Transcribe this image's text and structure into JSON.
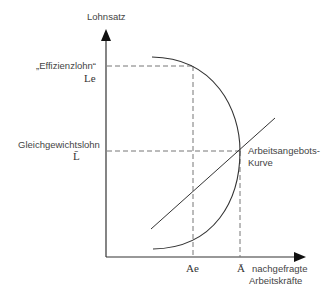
{
  "diagram": {
    "type": "economics-efficiency-wage-diagram",
    "y_axis": {
      "label": "Lohnsatz"
    },
    "x_axis": {
      "label_line1": "nachgefragte",
      "label_line2": "Arbeitskräfte"
    },
    "wage_levels": [
      {
        "name": "„Effizienzlohn“",
        "symbol": "Le"
      },
      {
        "name": "Gleichgewichtslohn",
        "symbol": "L̄"
      }
    ],
    "quantities": [
      {
        "symbol": "Ae"
      },
      {
        "symbol": "Ā"
      }
    ],
    "curves": [
      {
        "name": "Arbeitsangebots-Kurve",
        "label_line1": "Arbeitsangebots-",
        "label_line2": "Kurve",
        "shape": "upward-sloping line"
      },
      {
        "name": "Arbeitsnachfrage",
        "shape": "semicircular arc"
      }
    ],
    "colors": {
      "line": "#333333",
      "dashed": "#666666",
      "background": "#ffffff"
    }
  }
}
